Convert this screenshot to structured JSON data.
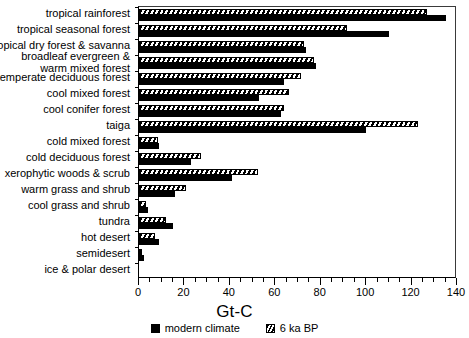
{
  "chart_data": {
    "type": "bar",
    "orientation": "horizontal",
    "title": "",
    "xlabel": "Gt-C",
    "ylabel": "",
    "xlim": [
      0,
      140
    ],
    "xticks": [
      0,
      20,
      40,
      60,
      80,
      100,
      120,
      140
    ],
    "xtick_labels": [
      "0",
      "20",
      "40",
      "60",
      "80",
      "100",
      "120",
      "140"
    ],
    "minor_tick_step": 5,
    "grid": false,
    "legend_position": "bottom-center",
    "categories": [
      "tropical rainforest",
      "tropical seasonal forest",
      "tropical dry forest & savanna",
      "broadleaf evergreen &\nwarm mixed forest",
      "temperate deciduous forest",
      "cool mixed forest",
      "cool conifer forest",
      "taiga",
      "cold mixed forest",
      "cold deciduous forest",
      "xerophytic woods & scrub",
      "warm grass and shrub",
      "cool grass and shrub",
      "tundra",
      "hot desert",
      "semidesert",
      "ice & polar desert"
    ],
    "series": [
      {
        "name": "modern climate",
        "pattern": "solid-black",
        "values": [
          135,
          110,
          73.5,
          78,
          64,
          53,
          62.5,
          100,
          9,
          23,
          41,
          16,
          4,
          15,
          9,
          2,
          0
        ]
      },
      {
        "name": "6 ka BP",
        "pattern": "hatched",
        "values": [
          127,
          91.5,
          72.5,
          77,
          71.5,
          66,
          64,
          123,
          8.5,
          27.5,
          52.5,
          20.5,
          3,
          12,
          7,
          1.5,
          0
        ]
      }
    ]
  },
  "legend": {
    "items": [
      {
        "label": "modern climate",
        "swatch": "solid-black-square"
      },
      {
        "label": "6 ka BP",
        "swatch": "hatched-square"
      }
    ]
  },
  "axis": {
    "x_title": "Gt-C"
  }
}
